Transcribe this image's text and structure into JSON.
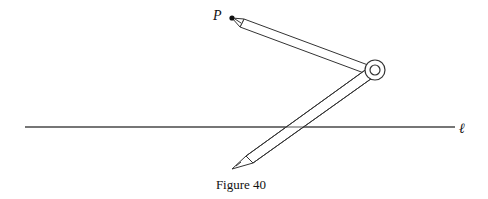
{
  "figure": {
    "caption": "Figure 40",
    "point_label": "P",
    "line_label": "ℓ",
    "elements": [
      "point P",
      "compass with two pencil legs",
      "pivot hinge",
      "horizontal line ℓ"
    ],
    "colors": {
      "stroke": "#333333",
      "background": "#ffffff"
    }
  }
}
